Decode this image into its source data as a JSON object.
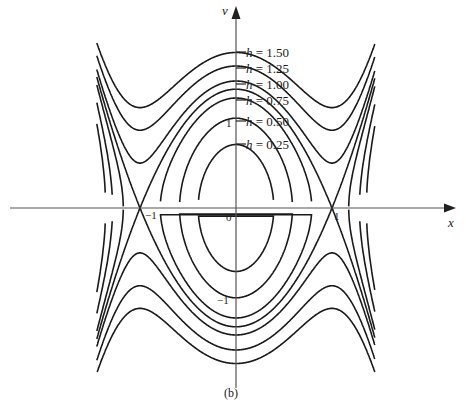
{
  "chart_data": {
    "type": "line",
    "title": "",
    "caption": "(b)",
    "xlabel": "x",
    "ylabel": "v",
    "x_ticks": [
      {
        "value": -1,
        "label": "−1"
      },
      {
        "value": 0,
        "label": "0"
      },
      {
        "value": 1,
        "label": "1"
      }
    ],
    "y_ticks": [
      {
        "value": 1,
        "label": "1"
      },
      {
        "value": -1,
        "label": "−1"
      }
    ],
    "levels": [
      {
        "label": "h = 1.50",
        "h": 1.5
      },
      {
        "label": "h = 1.25",
        "h": 1.25
      },
      {
        "label": "h = 1.00",
        "h": 1.0
      },
      {
        "label": "h = 0.75",
        "h": 0.75
      },
      {
        "label": "h = 0.50",
        "h": 0.5
      },
      {
        "label": "h = 0.25",
        "h": 0.25
      }
    ],
    "saddle_points": [
      [
        -1,
        0
      ],
      [
        1,
        0
      ]
    ],
    "grid": false,
    "legend": "inline labels along v-axis"
  },
  "layout": {
    "origin_px": [
      236,
      208
    ],
    "x_px_per_unit": 96,
    "v_px_per_unit": 168,
    "level_scale": 0.2857,
    "separatrix_h": 0.25,
    "line_color": "#1a1a1a",
    "axis_color": "#555555"
  },
  "labels": {
    "h150": {
      "h": "h",
      "rest": " = 1.50"
    },
    "h125": {
      "h": "h",
      "rest": " = 1.25"
    },
    "h100": {
      "h": "h",
      "rest": " = 1.00"
    },
    "h075": {
      "h": "h",
      "rest": " = 0.75"
    },
    "h050": {
      "h": "h",
      "rest": " = 0.50"
    },
    "h025": {
      "h": "h",
      "rest": " = 0.25"
    },
    "x_axis": "x",
    "v_axis": "v",
    "tick_x_neg1": "−1",
    "tick_x_0": "0",
    "tick_x_1": "1",
    "tick_v_1": "1",
    "tick_v_neg1": "−1",
    "caption": "(b)"
  }
}
